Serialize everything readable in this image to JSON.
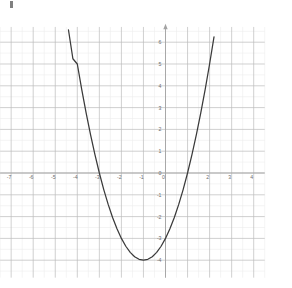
{
  "figure": {
    "kind": "coordinate-grid-plot",
    "background_color": "#ffffff",
    "minor_grid_color": "#e9e9e9",
    "major_grid_color": "#b9b9b9",
    "axis_color": "#a0a0a0",
    "curve_color": "#3a3a3a",
    "label_color": "#6e6e6e",
    "corner_mark_label": ""
  },
  "chart_data": {
    "type": "line",
    "title": "",
    "subtitle": "",
    "xlabel": "",
    "ylabel": "",
    "xlim": [
      -7.5,
      4.5
    ],
    "ylim": [
      -4.8,
      6.7
    ],
    "grid": true,
    "minor_grid": true,
    "legend": null,
    "legend_position": "none",
    "x_ticks": [
      -7,
      -6,
      -5,
      -4,
      -3,
      -2,
      -1,
      0,
      1,
      2,
      3,
      4
    ],
    "x_tick_labels": [
      "-7",
      "-6",
      "-5",
      "-4",
      "-3",
      "-2",
      "-1",
      "0",
      "",
      "2",
      "3",
      "4"
    ],
    "y_ticks": [
      -4,
      -3,
      -2,
      -1,
      0,
      1,
      2,
      3,
      4,
      5,
      6
    ],
    "y_tick_labels": [
      "-4",
      "-3",
      "-2",
      "-1",
      "0",
      "1",
      "2",
      "3",
      "4",
      "5",
      "6"
    ],
    "series": [
      {
        "name": "parabola",
        "equation": "y = x^2 + 2x - 3",
        "vertex": [
          -1,
          -4
        ],
        "x_intercepts": [
          -3,
          1
        ],
        "y_intercept": -3,
        "color": "#3a3a3a",
        "x": [
          -4.4,
          -4.2,
          -4.0,
          -3.8,
          -3.6,
          -3.4,
          -3.2,
          -3.0,
          -2.8,
          -2.6,
          -2.4,
          -2.2,
          -2.0,
          -1.8,
          -1.6,
          -1.4,
          -1.2,
          -1.0,
          -0.8,
          -0.6,
          -0.4,
          -0.2,
          0.0,
          0.2,
          0.4,
          0.6,
          0.8,
          1.0,
          1.2,
          1.4,
          1.6,
          1.8,
          2.0,
          2.2,
          2.4
        ],
        "y": [
          6.56,
          5.24,
          5.0,
          3.84,
          2.76,
          1.76,
          0.84,
          0.0,
          -0.76,
          -1.44,
          -2.04,
          -2.56,
          -3.0,
          -3.36,
          -3.64,
          -3.84,
          -3.96,
          -4.0,
          -3.96,
          -3.84,
          -3.64,
          -3.36,
          -3.0,
          -2.56,
          -2.04,
          -1.44,
          -0.76,
          0.0,
          0.84,
          1.76,
          2.76,
          3.84,
          5.0,
          6.24,
          7.56
        ]
      }
    ],
    "annotations": []
  },
  "axes": {
    "x_axis_name": "x-axis",
    "y_axis_name": "y-axis",
    "y_axis_arrow": true
  }
}
